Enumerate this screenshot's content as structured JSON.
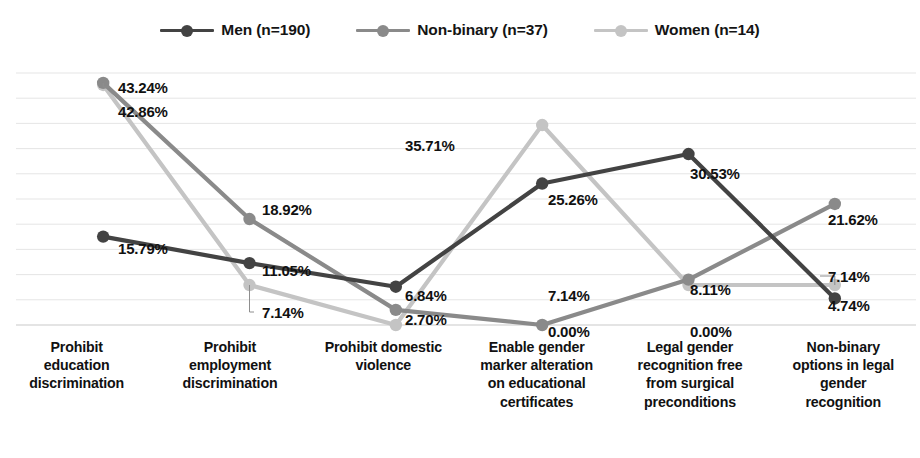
{
  "chart_data": {
    "type": "line",
    "title": "",
    "subtitle": "",
    "xlabel": "",
    "ylabel": "",
    "ylim": [
      0,
      45
    ],
    "grid": true,
    "gridlines": 10,
    "y_tick_labels_shown": false,
    "legend_position": "top-center",
    "value_format": "percent-2dp",
    "categories": [
      "Prohibit education discrimination",
      "Prohibit employment discrimination",
      "Prohibit domestic violence",
      "Enable gender marker alteration on educational certificates",
      "Legal gender recognition free from surgical preconditions",
      "Non-binary options in legal gender recognition"
    ],
    "category_lines": [
      [
        "Prohibit",
        "education",
        "discrimination"
      ],
      [
        "Prohibit",
        "employment",
        "discrimination"
      ],
      [
        "Prohibit domestic",
        "violence"
      ],
      [
        "Enable gender",
        "marker alteration",
        "on educational",
        "certificates"
      ],
      [
        "Legal gender",
        "recognition free",
        "from surgical",
        "preconditions"
      ],
      [
        "Non-binary",
        "options in legal",
        "gender",
        "recognition"
      ]
    ],
    "series": [
      {
        "name": "Men (n=190)",
        "short": "Men",
        "n": 190,
        "color": "#434343",
        "values": [
          15.79,
          11.05,
          6.84,
          25.26,
          30.53,
          4.74
        ],
        "labels": [
          "15.79%",
          "11.05%",
          "6.84%",
          "25.26%",
          "30.53%",
          "4.74%"
        ]
      },
      {
        "name": "Non-binary (n=37)",
        "short": "Non-binary",
        "n": 37,
        "color": "#8a8a8a",
        "values": [
          43.24,
          18.92,
          2.7,
          0.0,
          8.11,
          21.62
        ],
        "labels": [
          "43.24%",
          "18.92%",
          "2.70%",
          "0.00%",
          "8.11%",
          "21.62%"
        ]
      },
      {
        "name": "Women (n=14)",
        "short": "Women",
        "n": 14,
        "color": "#c4c4c4",
        "values": [
          42.86,
          7.14,
          0.0,
          35.71,
          7.14,
          7.14
        ],
        "labels": [
          "42.86%",
          "7.14%",
          "",
          "35.71%",
          "7.14%",
          "7.14%"
        ]
      }
    ],
    "point_labels": [
      {
        "text": "43.24%",
        "x": 118,
        "y": 20,
        "series": "Non-binary (n=37)",
        "category_index": 0,
        "leader": true
      },
      {
        "text": "42.86%",
        "x": 118,
        "y": 44,
        "series": "Women (n=14)",
        "category_index": 0,
        "leader": false
      },
      {
        "text": "15.79%",
        "x": 118,
        "y": 181,
        "series": "Men (n=190)",
        "category_index": 0,
        "leader": false
      },
      {
        "text": "18.92%",
        "x": 262,
        "y": 142,
        "series": "Non-binary (n=37)",
        "category_index": 1,
        "leader": false
      },
      {
        "text": "11.05%",
        "x": 262,
        "y": 203,
        "series": "Men (n=190)",
        "category_index": 1,
        "leader": false
      },
      {
        "text": "7.14%",
        "x": 262,
        "y": 245,
        "series": "Women (n=14)",
        "category_index": 1,
        "leader": true
      },
      {
        "text": "35.71%",
        "x": 405,
        "y": 78,
        "series": "Women (n=14)",
        "category_index": 3,
        "leader": false
      },
      {
        "text": "6.84%",
        "x": 405,
        "y": 228,
        "series": "Men (n=190)",
        "category_index": 2,
        "leader": false
      },
      {
        "text": "2.70%",
        "x": 405,
        "y": 252,
        "series": "Non-binary (n=37)",
        "category_index": 2,
        "leader": false
      },
      {
        "text": "25.26%",
        "x": 548,
        "y": 132,
        "series": "Men (n=190)",
        "category_index": 3,
        "leader": false
      },
      {
        "text": "7.14%",
        "x": 548,
        "y": 228,
        "series": "Women (n=14)",
        "category_index": 3,
        "leader": false
      },
      {
        "text": "0.00%",
        "x": 548,
        "y": 264,
        "series": "Non-binary (n=37)",
        "category_index": 3,
        "leader": false
      },
      {
        "text": "30.53%",
        "x": 690,
        "y": 106,
        "series": "Men (n=190)",
        "category_index": 4,
        "leader": false
      },
      {
        "text": "8.11%",
        "x": 690,
        "y": 222,
        "series": "Non-binary (n=37)",
        "category_index": 4,
        "leader": false
      },
      {
        "text": "0.00%",
        "x": 690,
        "y": 264,
        "series": "Women (n=14)",
        "category_index": 4,
        "leader": false
      },
      {
        "text": "21.62%",
        "x": 828,
        "y": 152,
        "series": "Non-binary (n=37)",
        "category_index": 5,
        "leader": false
      },
      {
        "text": "7.14%",
        "x": 828,
        "y": 209,
        "series": "Women (n=14)",
        "category_index": 5,
        "leader": true
      },
      {
        "text": "4.74%",
        "x": 828,
        "y": 238,
        "series": "Men (n=190)",
        "category_index": 5,
        "leader": false
      }
    ]
  }
}
